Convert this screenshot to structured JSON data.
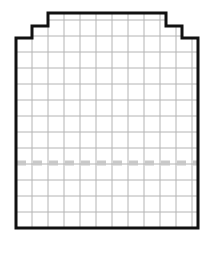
{
  "figure": {
    "title": "",
    "canvas": {
      "width": 214,
      "height": 258,
      "background": "#ffffff"
    },
    "shape": {
      "name": "stepped-grid-outline",
      "description": "Stair-stepped closed outline with two steps rising on each side to a flat central plateau",
      "stroke_color": "#111111",
      "stroke_width": 3,
      "fill_color": "#ffffff",
      "points": "16,38 16,228 198,228 198,38 182,38 182,26 166,26 166,13 48,13 48,26 32,26 32,38"
    },
    "grid": {
      "line_color": "#b4b4b4",
      "minor_line_color": "#d8d8d8",
      "line_width": 1,
      "cell_size": 16,
      "columns": 11,
      "rows": 12,
      "x_start": 16,
      "x_end": 198,
      "y_start": 13,
      "y_end": 228
    },
    "dashed_line": {
      "name": "center-dashed-line",
      "color": "#c9c9c9",
      "y": 163,
      "x_start": 17,
      "x_end": 197,
      "dash": "9 7",
      "width": 5
    }
  },
  "chart_data": {
    "type": "table",
    "title": "",
    "xlabel": "",
    "ylabel": "",
    "categories": [],
    "values": [],
    "grid": true,
    "legend": "none",
    "annotations": [
      "stepped black outline",
      "uniform square grid fill",
      "horizontal dashed centerline"
    ]
  }
}
